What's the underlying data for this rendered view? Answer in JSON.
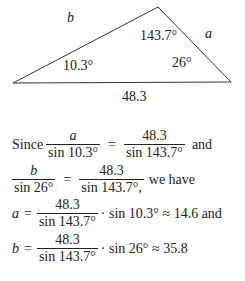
{
  "figure": {
    "side_b": "b",
    "side_a": "a",
    "side_c": "48.3",
    "angle_top": "143.7°",
    "angle_left": "10.3°",
    "angle_right": "26°",
    "vertices": {
      "left": [
        13,
        83
      ],
      "top": [
        158,
        7
      ],
      "right": [
        231,
        82
      ]
    }
  },
  "text": {
    "line1": {
      "prefix": "Since",
      "frac1_num": "a",
      "frac1_den": "sin 10.3°",
      "eq": "=",
      "frac2_num": "48.3",
      "frac2_den": "sin 143.7°",
      "suffix": "and"
    },
    "line2": {
      "frac1_num": "b",
      "frac1_den": "sin 26°",
      "eq": "=",
      "frac2_num": "48.3",
      "frac2_den": "sin 143.7°,",
      "suffix": "we have"
    },
    "line3": {
      "lhs": "a",
      "eq": "=",
      "frac_num": "48.3",
      "frac_den": "sin 143.7°",
      "rest": "· sin 10.3° ≈ 14.6 and"
    },
    "line4": {
      "lhs": "b",
      "eq": "=",
      "frac_num": "48.3",
      "frac_den": "sin 143.7°",
      "rest": "· sin 26° ≈ 35.8"
    }
  }
}
